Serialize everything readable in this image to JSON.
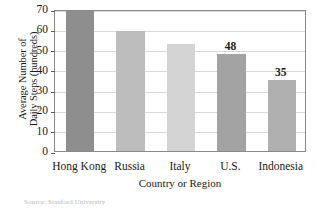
{
  "chart_data": {
    "type": "bar",
    "title": "",
    "xlabel": "Country or Region",
    "ylabel_line1": "Average Number of",
    "ylabel_line2": "Daily Steps (hundreds)",
    "categories": [
      "Hong Kong",
      "Russia",
      "Italy",
      "U.S.",
      "Indonesia"
    ],
    "values": [
      69,
      59,
      53,
      48,
      35
    ],
    "value_labels": [
      "",
      "",
      "",
      "48",
      "35"
    ],
    "ylim": [
      0,
      70
    ],
    "yticks": [
      0,
      10,
      20,
      30,
      40,
      50,
      60,
      70
    ],
    "ytick_labels": [
      "0",
      "10",
      "20",
      "30",
      "40",
      "50",
      "60",
      "70"
    ],
    "grid": true,
    "grid_axis": "y",
    "legend": false,
    "bar_colors": [
      "#8e8e8e",
      "#bdbdbd",
      "#d4d4d4",
      "#a3a3a3",
      "#b0b0b0"
    ]
  },
  "source": {
    "note": "Source: Stanford University"
  }
}
